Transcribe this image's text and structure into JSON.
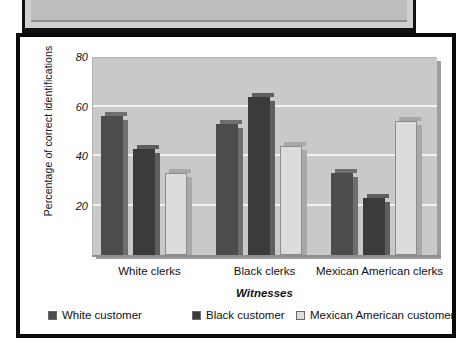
{
  "figure": {
    "frame_color": "#0a0a0a",
    "plot_background": "#c9c9c9",
    "gridline_color": "#f2f2f2"
  },
  "chart_data": {
    "type": "bar",
    "title": "",
    "subtitle": "",
    "xlabel": "Witnesses",
    "ylabel": "Percentage of correct identifications",
    "categories": [
      "White clerks",
      "Black clerks",
      "Mexican American clerks"
    ],
    "series": [
      {
        "name": "White customer",
        "color": "#4c4c4c",
        "side_color": "#6e6e6e",
        "values": [
          56,
          53,
          33
        ]
      },
      {
        "name": "Black customer",
        "color": "#3b3b3b",
        "side_color": "#5e5e5e",
        "values": [
          43,
          64,
          23
        ]
      },
      {
        "name": "Mexican American customer",
        "color": "#dcdcdc",
        "side_color": "#a8a8a8",
        "values": [
          33,
          44,
          54
        ]
      }
    ],
    "ylim": [
      0,
      80
    ],
    "yticks": [
      20,
      40,
      60,
      80
    ],
    "ytick_labels": [
      "20",
      "40",
      "60",
      "80"
    ],
    "grid": true,
    "legend_position": "bottom"
  },
  "legend": {
    "items": [
      {
        "label": "White customer",
        "color": "#4c4c4c"
      },
      {
        "label": "Black customer",
        "color": "#3b3b3b"
      },
      {
        "label": "Mexican American customer",
        "color": "#dcdcdc"
      }
    ]
  }
}
